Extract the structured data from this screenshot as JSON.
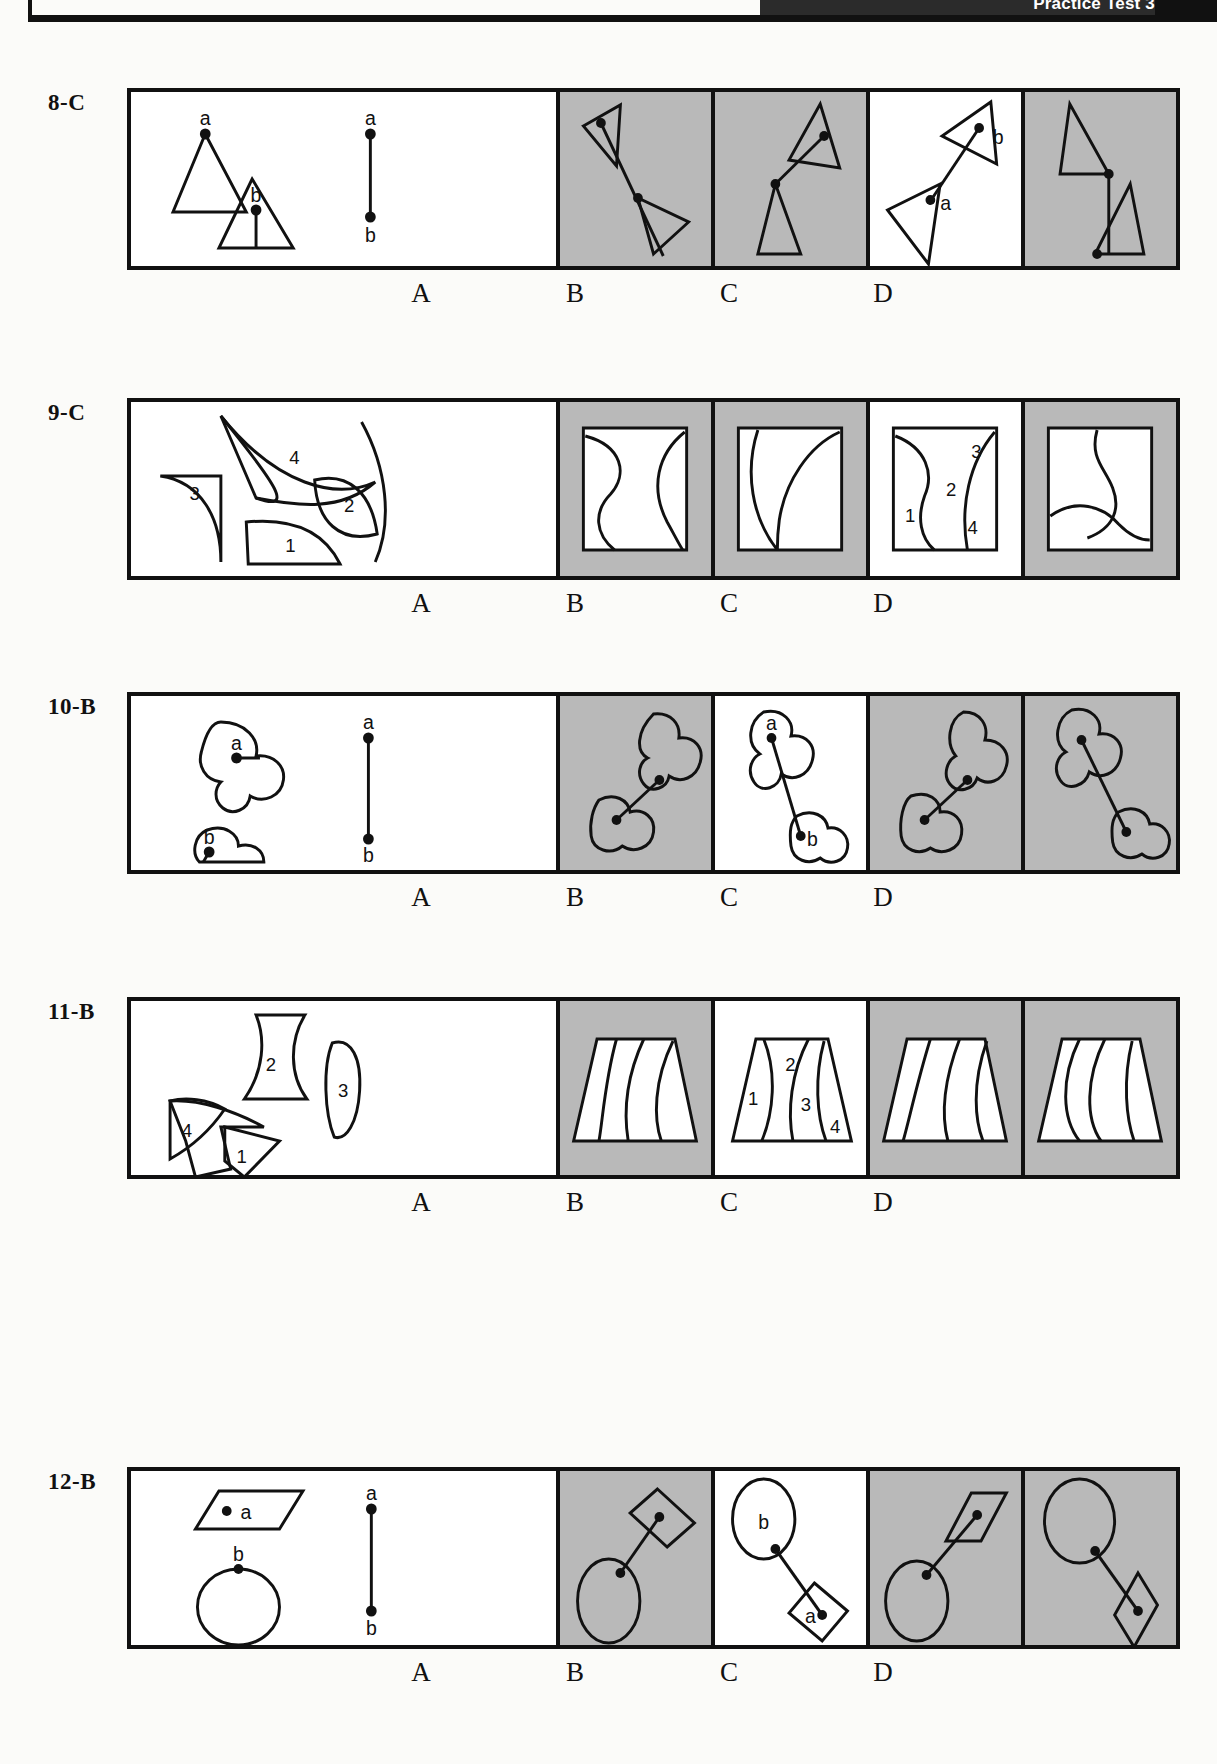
{
  "header": {
    "title": "Practice Test 3"
  },
  "option_labels": [
    "A",
    "B",
    "C",
    "D"
  ],
  "questions": [
    {
      "number": "8",
      "answer": "C",
      "label": "8-C",
      "type": "connected-figures",
      "reference_markers": [
        "a",
        "b"
      ],
      "panel_shading": [
        "white",
        "shaded",
        "shaded",
        "white",
        "shaded"
      ],
      "option_markers": {
        "A": [],
        "B": [],
        "C": [
          "b",
          "a"
        ],
        "D": []
      }
    },
    {
      "number": "9",
      "answer": "C",
      "label": "9-C",
      "type": "pattern-assembly",
      "reference_markers": [
        "4",
        "3",
        "2",
        "1"
      ],
      "panel_shading": [
        "white",
        "shaded",
        "shaded",
        "white",
        "shaded"
      ],
      "option_markers": {
        "A": [],
        "B": [],
        "C": [
          "3",
          "2",
          "1",
          "4"
        ],
        "D": []
      }
    },
    {
      "number": "10",
      "answer": "B",
      "label": "10-B",
      "type": "connected-figures",
      "reference_markers": [
        "a",
        "b"
      ],
      "panel_shading": [
        "white",
        "shaded",
        "white",
        "shaded",
        "shaded"
      ],
      "option_markers": {
        "A": [],
        "B": [
          "a",
          "b"
        ],
        "C": [],
        "D": []
      }
    },
    {
      "number": "11",
      "answer": "B",
      "label": "11-B",
      "type": "pattern-assembly",
      "reference_markers": [
        "2",
        "3",
        "4",
        "1"
      ],
      "panel_shading": [
        "white",
        "shaded",
        "white",
        "shaded",
        "shaded"
      ],
      "option_markers": {
        "A": [],
        "B": [
          "2",
          "1",
          "3",
          "4"
        ],
        "C": [],
        "D": []
      }
    },
    {
      "number": "12",
      "answer": "B",
      "label": "12-B",
      "type": "connected-figures",
      "reference_markers": [
        "a",
        "b"
      ],
      "panel_shading": [
        "white",
        "shaded",
        "white",
        "shaded",
        "shaded"
      ],
      "option_markers": {
        "A": [],
        "B": [
          "b",
          "a"
        ],
        "C": [],
        "D": []
      }
    }
  ],
  "colors": {
    "ink": "#111111",
    "shaded_panel": "#b9b9b9",
    "page": "#fbfbf9"
  }
}
